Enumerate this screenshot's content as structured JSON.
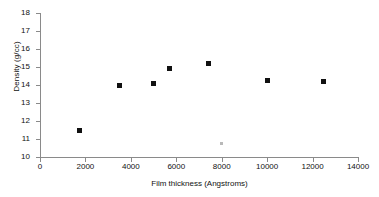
{
  "chart_data": {
    "type": "scatter",
    "title": "",
    "xlabel": "Film thickness (Angstroms)",
    "ylabel": "Density (g/cc)",
    "xlim": [
      0,
      14000
    ],
    "ylim": [
      10,
      18
    ],
    "xticks": [
      0,
      2000,
      4000,
      6000,
      8000,
      10000,
      12000,
      14000
    ],
    "yticks": [
      10,
      11,
      12,
      13,
      14,
      15,
      16,
      17,
      18
    ],
    "xtick_labels": [
      "0",
      "2000",
      "4000",
      "6000",
      "8000",
      "10000",
      "12000",
      "14000"
    ],
    "ytick_labels": [
      "10",
      "11",
      "12",
      "13",
      "14",
      "15",
      "16",
      "17",
      "18"
    ],
    "grid": false,
    "legend": false,
    "marker_color": "#111111",
    "axis_color": "#8a8a8a",
    "series": [
      {
        "name": "Density vs film thickness",
        "marker": "square",
        "points": [
          {
            "x": 1750,
            "y": 11.5,
            "faint": false
          },
          {
            "x": 3500,
            "y": 14.0,
            "faint": false
          },
          {
            "x": 5000,
            "y": 14.1,
            "faint": false
          },
          {
            "x": 5700,
            "y": 14.9,
            "faint": false
          },
          {
            "x": 7400,
            "y": 15.2,
            "faint": false
          },
          {
            "x": 8000,
            "y": 10.75,
            "faint": true
          },
          {
            "x": 10000,
            "y": 14.25,
            "faint": false
          },
          {
            "x": 12500,
            "y": 14.2,
            "faint": false
          }
        ]
      }
    ]
  }
}
